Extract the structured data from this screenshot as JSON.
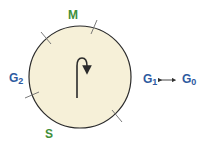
{
  "diagram": {
    "colors": {
      "circle_fill": "#f6f0d8",
      "circle_stroke": "#2b2b2b",
      "tick": "#6b6b6b",
      "green_label": "#3f8f3a",
      "blue_label": "#2e5aa0"
    },
    "labels": {
      "m": {
        "text": "M"
      },
      "s": {
        "text": "S"
      },
      "g2": {
        "base": "G",
        "sub": "2"
      },
      "g1": {
        "base": "G",
        "sub": "1"
      },
      "g0": {
        "base": "G",
        "sub": "0"
      }
    },
    "connector": {
      "type": "double-arrow",
      "between": [
        "G1",
        "G0"
      ]
    },
    "center_arrow": {
      "type": "hook-arrow",
      "direction": "clockwise"
    }
  }
}
